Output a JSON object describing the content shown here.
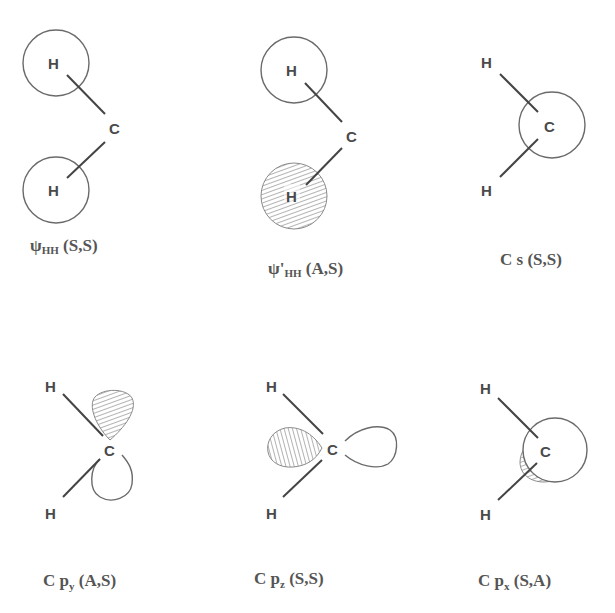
{
  "figure": {
    "panels": [
      {
        "id": "psi-hh",
        "caption_main": "ψ",
        "caption_sub": "HH",
        "caption_sym": " (S,S)",
        "atoms": [
          "H",
          "C",
          "H"
        ],
        "orbital": "two unshaded H 1s circles (in-phase)"
      },
      {
        "id": "psi-prime-hh",
        "caption_main": "ψ'",
        "caption_sub": "HH",
        "caption_sym": " (A,S)",
        "atoms": [
          "H",
          "C",
          "H"
        ],
        "orbital": "top H circle open, bottom H circle hatched (out-of-phase)"
      },
      {
        "id": "c-s",
        "caption_main": "C s",
        "caption_sub": "",
        "caption_sym": " (S,S)",
        "atoms": [
          "H",
          "C",
          "H"
        ],
        "orbital": "carbon 2s circle"
      },
      {
        "id": "c-py",
        "caption_main": "C p",
        "caption_sub": "y",
        "caption_sym": " (A,S)",
        "atoms": [
          "H",
          "C",
          "H"
        ],
        "orbital": "p lobe up hatched, down open"
      },
      {
        "id": "c-pz",
        "caption_main": "C p",
        "caption_sub": "z",
        "caption_sym": " (S,S)",
        "atoms": [
          "H",
          "C",
          "H"
        ],
        "orbital": "p lobe left hatched, right open"
      },
      {
        "id": "c-px",
        "caption_main": "C p",
        "caption_sub": "x",
        "caption_sym": " (S,A)",
        "atoms": [
          "H",
          "C",
          "H"
        ],
        "orbital": "p lobe toward viewer open, back lobe hatched crescent"
      }
    ],
    "labels": {
      "H": "H",
      "C": "C"
    },
    "colors": {
      "line": "#444444",
      "orbital_stroke": "#6a6a6a",
      "hatch": "#8a8a8a",
      "text": "#4a4a4a"
    }
  }
}
